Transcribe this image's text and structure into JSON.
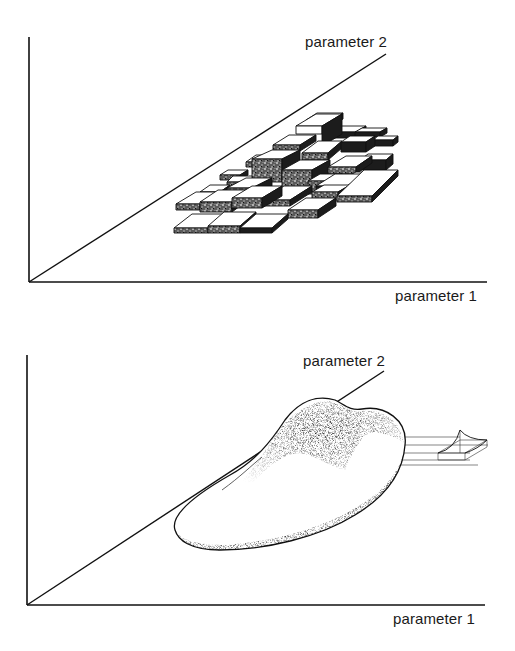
{
  "figure": {
    "panels": [
      {
        "id": "top",
        "description": "3D histogram of blocks over parameter plane",
        "axis_x_label": "parameter 1",
        "axis_y_label": "parameter 2"
      },
      {
        "id": "bottom",
        "description": "Smooth 3D density surface over parameter plane with wireframe boxes",
        "axis_x_label": "parameter 1",
        "axis_y_label": "parameter 2"
      }
    ]
  },
  "colors": {
    "ink": "#111111",
    "background": "#ffffff",
    "block_top": "#ffffff",
    "block_side_dark": "#1c1c1c",
    "block_side_speckle": "#8a8a8a"
  }
}
